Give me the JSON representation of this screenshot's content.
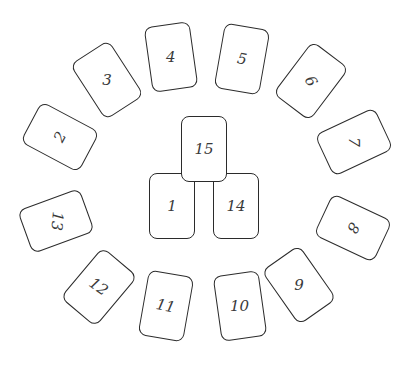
{
  "colors": {
    "card_border": "#2b2b2b",
    "card_fill": "#ffffff",
    "number_text": "#3a3a3a",
    "background": "#ffffff"
  },
  "cards": [
    {
      "label": "1",
      "x": 172,
      "y": 206,
      "rot": 0,
      "text_rot": 0
    },
    {
      "label": "2",
      "x": 60,
      "y": 137,
      "rot": -62,
      "text_rot": -62
    },
    {
      "label": "3",
      "x": 107,
      "y": 80,
      "rot": -33,
      "text_rot": 0
    },
    {
      "label": "4",
      "x": 171,
      "y": 57,
      "rot": -8,
      "text_rot": 0
    },
    {
      "label": "5",
      "x": 242,
      "y": 59,
      "rot": 10,
      "text_rot": 10
    },
    {
      "label": "6",
      "x": 311,
      "y": 81,
      "rot": 37,
      "text_rot": 60
    },
    {
      "label": "7",
      "x": 354,
      "y": 142,
      "rot": 65,
      "text_rot": 90
    },
    {
      "label": "8",
      "x": 353,
      "y": 228,
      "rot": 115,
      "text_rot": 120
    },
    {
      "label": "9",
      "x": 299,
      "y": 285,
      "rot": -35,
      "text_rot": 0
    },
    {
      "label": "10",
      "x": 240,
      "y": 306,
      "rot": -8,
      "text_rot": 0
    },
    {
      "label": "11",
      "x": 166,
      "y": 306,
      "rot": 10,
      "text_rot": 12
    },
    {
      "label": "12",
      "x": 99,
      "y": 287,
      "rot": 40,
      "text_rot": 35
    },
    {
      "label": "13",
      "x": 56,
      "y": 221,
      "rot": -110,
      "text_rot": 95
    },
    {
      "label": "14",
      "x": 236,
      "y": 206,
      "rot": 0,
      "text_rot": 0
    },
    {
      "label": "15",
      "x": 204,
      "y": 149,
      "rot": 0,
      "text_rot": 0
    }
  ]
}
